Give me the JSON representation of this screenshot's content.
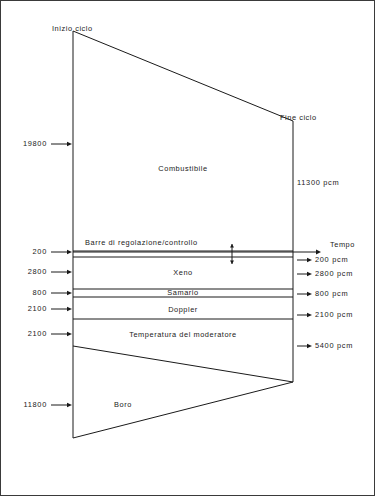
{
  "diagram": {
    "title_start": "Inizio ciclo",
    "title_end": "Fine ciclo",
    "axis_label": "Tempo",
    "regions": [
      {
        "name": "Combustibile",
        "left_value": "19800",
        "right_value": "11300 pcm"
      },
      {
        "name": "Barre di regolazione/controllo",
        "left_value": "200",
        "right_value": "200 pcm"
      },
      {
        "name": "Xeno",
        "left_value": "2800",
        "right_value": "2800 pcm"
      },
      {
        "name": "Samario",
        "left_value": "800",
        "right_value": "800 pcm"
      },
      {
        "name": "Doppler",
        "left_value": "2100",
        "right_value": "2100 pcm"
      },
      {
        "name": "Temperatura del moderatore",
        "left_value": "2100",
        "right_value": "5400 pcm"
      },
      {
        "name": "Boro",
        "left_value": "11800",
        "right_value": ""
      }
    ],
    "left_values": {
      "combustibile": "19800",
      "barre": "200",
      "xeno": "2800",
      "samario": "800",
      "doppler": "2100",
      "moderatore": "2100",
      "boro": "11800"
    },
    "right_values": {
      "combustibile": "11300 pcm",
      "barre": "200 pcm",
      "xeno": "2800 pcm",
      "samario": "800 pcm",
      "doppler": "2100 pcm",
      "moderatore": "5400 pcm"
    },
    "region_labels": {
      "combustibile": "Combustibile",
      "barre": "Barre di regolazione/controllo",
      "xeno": "Xeno",
      "samario": "Samario",
      "doppler": "Doppler",
      "moderatore": "Temperatura del moderatore",
      "boro": "Boro"
    },
    "colors": {
      "line": "#1a1a1a",
      "border": "#3a3a3a",
      "background": "#ffffff"
    }
  }
}
